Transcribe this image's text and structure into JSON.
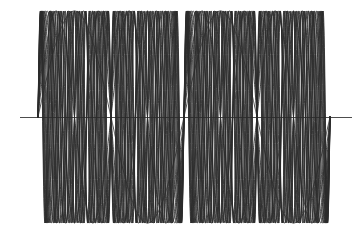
{
  "figure": {
    "background_color": "#ffffff",
    "width": 358,
    "height": 236,
    "title": "",
    "subtitle": ""
  },
  "axis": {
    "name": "horizontal-zero-axis",
    "color": "#3a3a3a",
    "y_pixel": 117,
    "x_start_pixel": 20,
    "x_end_pixel": 352,
    "stroke_width": 0.9,
    "label": ""
  },
  "plot_area": {
    "x_left_pixel": 38,
    "x_right_pixel": 330,
    "y_top_pixel": 11,
    "y_bottom_pixel": 220,
    "baseline_pixel": 117,
    "amplitude_pixel": 106
  },
  "style": {
    "line_color": "#2b2b2b",
    "line_width": 0.85,
    "grid": false,
    "legend": false,
    "ticks": false,
    "tick_labels": false,
    "frame": false
  },
  "chart_data": {
    "type": "line",
    "title": "",
    "subtitle": "",
    "xlabel": "",
    "ylabel": "",
    "xlim": [
      0,
      12.566370614359172
    ],
    "ylim": [
      -1,
      1
    ],
    "grid": false,
    "legend": false,
    "legend_position": "none",
    "annotations": [],
    "x_tick_labels": [],
    "y_tick_labels": [],
    "x_samples": 1200,
    "nodes_x": [
      0,
      6.283185307179586,
      12.566370614359172
    ],
    "series": [
      {
        "name": "sin(1x)",
        "harmonic": 1,
        "amplitude": 1,
        "formula": "sin(1*x)"
      },
      {
        "name": "sin(2x)",
        "harmonic": 2,
        "amplitude": 1,
        "formula": "sin(2*x)"
      },
      {
        "name": "sin(3x)",
        "harmonic": 3,
        "amplitude": 1,
        "formula": "sin(3*x)"
      },
      {
        "name": "sin(4x)",
        "harmonic": 4,
        "amplitude": 1,
        "formula": "sin(4*x)"
      },
      {
        "name": "sin(5x)",
        "harmonic": 5,
        "amplitude": 1,
        "formula": "sin(5*x)"
      },
      {
        "name": "sin(6x)",
        "harmonic": 6,
        "amplitude": 1,
        "formula": "sin(6*x)"
      },
      {
        "name": "sin(7x)",
        "harmonic": 7,
        "amplitude": 1,
        "formula": "sin(7*x)"
      },
      {
        "name": "sin(8x)",
        "harmonic": 8,
        "amplitude": 1,
        "formula": "sin(8*x)"
      },
      {
        "name": "sin(9x)",
        "harmonic": 9,
        "amplitude": 1,
        "formula": "sin(9*x)"
      },
      {
        "name": "sin(10x)",
        "harmonic": 10,
        "amplitude": 1,
        "formula": "sin(10*x)"
      },
      {
        "name": "sin(11x)",
        "harmonic": 11,
        "amplitude": 1,
        "formula": "sin(11*x)"
      },
      {
        "name": "sin(12x)",
        "harmonic": 12,
        "amplitude": 1,
        "formula": "sin(12*x)"
      },
      {
        "name": "sin(13x)",
        "harmonic": 13,
        "amplitude": 1,
        "formula": "sin(13*x)"
      },
      {
        "name": "sin(14x)",
        "harmonic": 14,
        "amplitude": 1,
        "formula": "sin(14*x)"
      },
      {
        "name": "sin(15x)",
        "harmonic": 15,
        "amplitude": 1,
        "formula": "sin(15*x)"
      },
      {
        "name": "sin(16x)",
        "harmonic": 16,
        "amplitude": 1,
        "formula": "sin(16*x)"
      }
    ]
  }
}
